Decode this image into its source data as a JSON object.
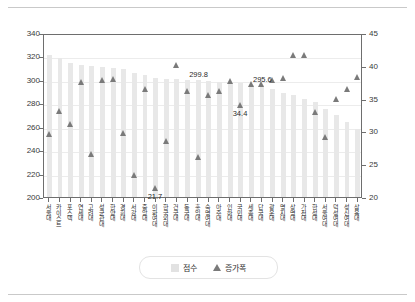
{
  "chart_data": {
    "type": "bar",
    "title": "",
    "subtitle": "",
    "xlabel": "",
    "ylabel": "",
    "y2label": "",
    "grid": true,
    "legend_position": "bottom-center",
    "ylim": [
      200,
      340
    ],
    "y2lim": [
      20,
      45
    ],
    "yticks": [
      "200",
      "220",
      "240",
      "260",
      "280",
      "300",
      "320",
      "340"
    ],
    "y2ticks": [
      "20",
      "25",
      "30",
      "35",
      "40",
      "45"
    ],
    "categories": [
      "서울대",
      "카이스트",
      "포스텍",
      "연세대",
      "고려대",
      "성균관대",
      "한양대",
      "경희대",
      "서강대",
      "중앙대",
      "이화여대",
      "한국외대",
      "건국대",
      "동국대",
      "홍익대",
      "숙명여대",
      "아주대",
      "인하대",
      "국민대",
      "세종대",
      "단국대",
      "광운대",
      "명지대",
      "상명대",
      "가천대",
      "한성대",
      "서울여대",
      "덕성여대",
      "성신여대",
      "삼육대"
    ],
    "series": [
      {
        "name": "점수",
        "axis": "left",
        "type": "bar",
        "color": "#e8e8e8",
        "values": [
          321.0,
          319.0,
          314.0,
          312.5,
          312.0,
          311.0,
          310.5,
          309.0,
          305.5,
          304.0,
          301.5,
          301.0,
          300.5,
          300.0,
          299.8,
          299.0,
          298.5,
          297.5,
          297.0,
          296.0,
          295.6,
          292.0,
          289.0,
          287.0,
          284.0,
          281.0,
          275.0,
          270.0,
          264.0,
          258.0
        ]
      },
      {
        "name": "증가폭",
        "axis": "right",
        "type": "scatter",
        "marker": "triangle",
        "color": "#7a7a7a",
        "values": [
          29.9,
          33.4,
          31.4,
          37.8,
          26.9,
          38.2,
          38.3,
          30.1,
          23.7,
          36.8,
          21.7,
          28.9,
          40.5,
          36.5,
          26.4,
          35.9,
          36.4,
          38.0,
          34.4,
          37.6,
          37.6,
          38.2,
          38.5,
          42.0,
          42.0,
          33.3,
          29.5,
          35.2,
          36.8,
          38.6
        ]
      }
    ],
    "data_labels": [
      {
        "text": "299.8",
        "series": "점수",
        "category_index": 14
      },
      {
        "text": "295.6",
        "series": "점수",
        "category_index": 20
      },
      {
        "text": "34.4",
        "series": "증가폭",
        "category_index": 18
      },
      {
        "text": "21.7",
        "series": "증가폭",
        "category_index": 10
      }
    ]
  },
  "legend": {
    "items": [
      {
        "label": "점수",
        "marker": "square-swatch",
        "color": "#e2e2e2"
      },
      {
        "label": "증가폭",
        "marker": "triangle-up",
        "color": "#7a7a7a"
      }
    ]
  }
}
